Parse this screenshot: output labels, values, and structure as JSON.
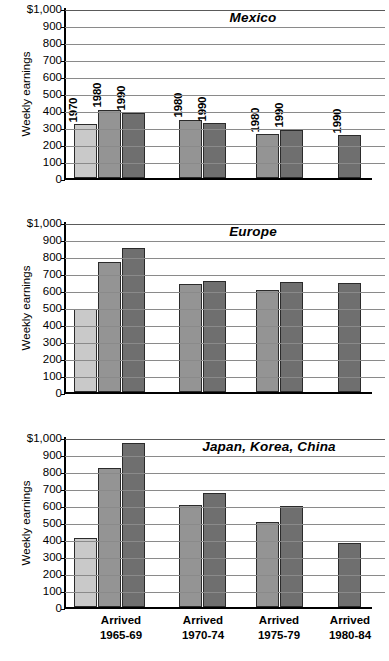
{
  "figure": {
    "ylabel": "Weekly earnings",
    "y_ticks": [
      "$1,000",
      "900",
      "800",
      "700",
      "600",
      "500",
      "400",
      "300",
      "200",
      "100",
      "0"
    ],
    "ylim": [
      0,
      1000
    ],
    "group_labels": [
      {
        "line1": "Arrived",
        "line2": "1965-69"
      },
      {
        "line1": "Arrived",
        "line2": "1970-74"
      },
      {
        "line1": "Arrived",
        "line2": "1975-79"
      },
      {
        "line1": "Arrived",
        "line2": "1980-84"
      }
    ],
    "colors": {
      "series_1970": "#c9c9c9",
      "series_1980": "#949494",
      "series_1990": "#6f6f6f",
      "grid": "#8a8a8a",
      "axis": "#000000"
    }
  },
  "chart_data": [
    {
      "type": "bar",
      "title": "Mexico",
      "xlabel": "",
      "ylabel": "Weekly earnings",
      "ylim": [
        0,
        1000
      ],
      "grid": true,
      "legend": "none",
      "categories": [
        "Arrived 1965-69",
        "Arrived 1970-74",
        "Arrived 1975-79",
        "Arrived 1980-84"
      ],
      "show_bar_labels": true,
      "bars": [
        {
          "group": "Arrived 1965-69",
          "year": "1970",
          "value": 320,
          "series": 0
        },
        {
          "group": "Arrived 1965-69",
          "year": "1980",
          "value": 405,
          "series": 1
        },
        {
          "group": "Arrived 1965-69",
          "year": "1990",
          "value": 385,
          "series": 2
        },
        {
          "group": "Arrived 1970-74",
          "year": "1980",
          "value": 345,
          "series": 1
        },
        {
          "group": "Arrived 1970-74",
          "year": "1990",
          "value": 325,
          "series": 2
        },
        {
          "group": "Arrived 1975-79",
          "year": "1980",
          "value": 260,
          "series": 1
        },
        {
          "group": "Arrived 1975-79",
          "year": "1990",
          "value": 285,
          "series": 2
        },
        {
          "group": "Arrived 1980-84",
          "year": "1990",
          "value": 255,
          "series": 2
        }
      ]
    },
    {
      "type": "bar",
      "title": "Europe",
      "xlabel": "",
      "ylabel": "Weekly earnings",
      "ylim": [
        0,
        1000
      ],
      "grid": true,
      "legend": "none",
      "categories": [
        "Arrived 1965-69",
        "Arrived 1970-74",
        "Arrived 1975-79",
        "Arrived 1980-84"
      ],
      "show_bar_labels": false,
      "bars": [
        {
          "group": "Arrived 1965-69",
          "year": "1970",
          "value": 490,
          "series": 0
        },
        {
          "group": "Arrived 1965-69",
          "year": "1980",
          "value": 765,
          "series": 1
        },
        {
          "group": "Arrived 1965-69",
          "year": "1990",
          "value": 850,
          "series": 2
        },
        {
          "group": "Arrived 1970-74",
          "year": "1980",
          "value": 640,
          "series": 1
        },
        {
          "group": "Arrived 1970-74",
          "year": "1990",
          "value": 655,
          "series": 2
        },
        {
          "group": "Arrived 1975-79",
          "year": "1980",
          "value": 605,
          "series": 1
        },
        {
          "group": "Arrived 1975-79",
          "year": "1990",
          "value": 652,
          "series": 2
        },
        {
          "group": "Arrived 1980-84",
          "year": "1990",
          "value": 645,
          "series": 2
        }
      ]
    },
    {
      "type": "bar",
      "title": "Japan, Korea, China",
      "xlabel": "",
      "ylabel": "Weekly earnings",
      "ylim": [
        0,
        1000
      ],
      "grid": true,
      "legend": "none",
      "categories": [
        "Arrived 1965-69",
        "Arrived 1970-74",
        "Arrived 1975-79",
        "Arrived 1980-84"
      ],
      "show_bar_labels": false,
      "bars": [
        {
          "group": "Arrived 1965-69",
          "year": "1970",
          "value": 410,
          "series": 0
        },
        {
          "group": "Arrived 1965-69",
          "year": "1980",
          "value": 820,
          "series": 1
        },
        {
          "group": "Arrived 1965-69",
          "year": "1990",
          "value": 970,
          "series": 2
        },
        {
          "group": "Arrived 1970-74",
          "year": "1980",
          "value": 600,
          "series": 1
        },
        {
          "group": "Arrived 1970-74",
          "year": "1990",
          "value": 675,
          "series": 2
        },
        {
          "group": "Arrived 1975-79",
          "year": "1980",
          "value": 500,
          "series": 1
        },
        {
          "group": "Arrived 1975-79",
          "year": "1990",
          "value": 595,
          "series": 2
        },
        {
          "group": "Arrived 1980-84",
          "year": "1990",
          "value": 380,
          "series": 2
        }
      ]
    }
  ]
}
